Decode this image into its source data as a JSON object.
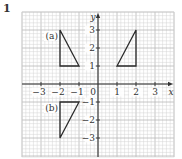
{
  "question_number": "1",
  "axes": {
    "x_label": "x",
    "y_label": "y",
    "origin_label": "0",
    "x_ticks": [
      {
        "value": -3,
        "label": "−3"
      },
      {
        "value": -2,
        "label": "−2"
      },
      {
        "value": -1,
        "label": "−1"
      },
      {
        "value": 1,
        "label": "1"
      },
      {
        "value": 2,
        "label": "2"
      },
      {
        "value": 3,
        "label": "3"
      }
    ],
    "y_ticks": [
      {
        "value": 3,
        "label": "3"
      },
      {
        "value": 2,
        "label": "2"
      },
      {
        "value": 1,
        "label": "1"
      },
      {
        "value": -1,
        "label": "−1"
      },
      {
        "value": -2,
        "label": "−2"
      },
      {
        "value": -3,
        "label": "−3"
      }
    ]
  },
  "shapes": [
    {
      "label": "(a)",
      "name": "triangle-a",
      "vertices": [
        [
          -2,
          3
        ],
        [
          -2,
          1
        ],
        [
          -1,
          1
        ]
      ]
    },
    {
      "label": "",
      "name": "triangle-object",
      "vertices": [
        [
          1,
          1
        ],
        [
          2,
          1
        ],
        [
          2,
          3
        ]
      ]
    },
    {
      "label": "(b)",
      "name": "triangle-b",
      "vertices": [
        [
          -2,
          -1
        ],
        [
          -1,
          -1
        ],
        [
          -2,
          -3
        ]
      ]
    }
  ],
  "labels": {
    "a": "(a)",
    "b": "(b)"
  },
  "colors": {
    "grid_minor": "#d4d4d4",
    "grid_major": "#b8b8b8",
    "axis": "#333333",
    "shape": "#2a2a2a"
  }
}
